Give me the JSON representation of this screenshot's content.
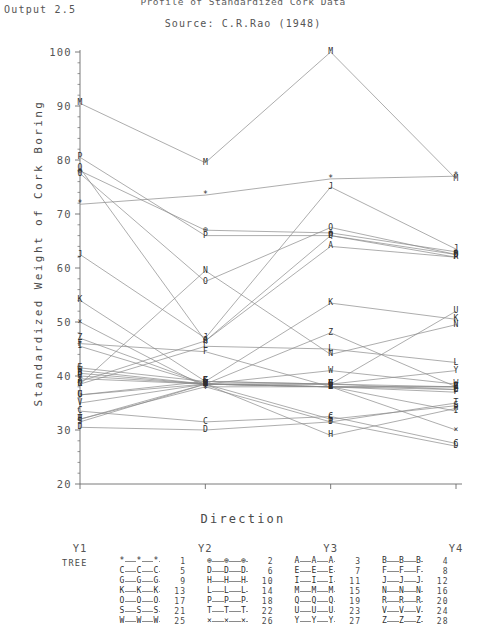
{
  "header": {
    "output_label": "Output 2.5",
    "title": "Profile of Standardized Cork Data",
    "source": "Source: C.R.Rao (1948)"
  },
  "chart_data": {
    "type": "line",
    "title": "Profile of Standardized Cork Data",
    "subtitle": "Source: C.R.Rao (1948)",
    "xlabel": "Direction",
    "ylabel": "Standardized Weight of Cork Boring",
    "categories": [
      "Y1",
      "Y2",
      "Y3",
      "Y4"
    ],
    "yticks": [
      20,
      30,
      40,
      50,
      60,
      70,
      80,
      90,
      100
    ],
    "ylim": [
      20,
      100
    ],
    "grid": false,
    "legend_position": "bottom",
    "legend_title": "TREE",
    "series": [
      {
        "name": "1",
        "marker": "*",
        "values": [
          71.8,
          73.5,
          76.5,
          77.0
        ]
      },
      {
        "name": "2",
        "marker": "⊕",
        "values": [
          78.0,
          67.0,
          66.5,
          63.0
        ]
      },
      {
        "name": "3",
        "marker": "A",
        "values": [
          39.0,
          46.5,
          64.0,
          62.0
        ]
      },
      {
        "name": "4",
        "marker": "B",
        "values": [
          40.5,
          38.5,
          38.0,
          37.5
        ]
      },
      {
        "name": "5",
        "marker": "C",
        "values": [
          33.5,
          31.5,
          32.5,
          27.5
        ]
      },
      {
        "name": "6",
        "marker": "D",
        "values": [
          30.5,
          30.0,
          31.5,
          27.0
        ]
      },
      {
        "name": "7",
        "marker": "E",
        "values": [
          41.5,
          39.0,
          38.5,
          37.5
        ]
      },
      {
        "name": "8",
        "marker": "F",
        "values": [
          46.0,
          44.5,
          38.0,
          37.0
        ]
      },
      {
        "name": "9",
        "marker": "G",
        "values": [
          36.5,
          39.0,
          38.5,
          38.0
        ]
      },
      {
        "name": "10",
        "marker": "H",
        "values": [
          32.0,
          38.5,
          29.0,
          34.0
        ]
      },
      {
        "name": "11",
        "marker": "I",
        "values": [
          45.5,
          38.5,
          38.0,
          33.5
        ]
      },
      {
        "name": "12",
        "marker": "J",
        "values": [
          62.5,
          47.0,
          75.0,
          63.5
        ]
      },
      {
        "name": "13",
        "marker": "K",
        "values": [
          54.0,
          39.0,
          53.5,
          50.5
        ]
      },
      {
        "name": "14",
        "marker": "L",
        "values": [
          38.5,
          45.5,
          45.0,
          42.5
        ]
      },
      {
        "name": "15",
        "marker": "M",
        "values": [
          90.5,
          79.5,
          100.0,
          76.5
        ]
      },
      {
        "name": "16",
        "marker": "N",
        "values": [
          38.5,
          59.5,
          44.0,
          49.5
        ]
      },
      {
        "name": "17",
        "marker": "O",
        "values": [
          77.5,
          57.5,
          67.5,
          62.5
        ]
      },
      {
        "name": "18",
        "marker": "P",
        "values": [
          80.5,
          66.0,
          66.0,
          62.0
        ]
      },
      {
        "name": "19",
        "marker": "Q",
        "values": [
          78.5,
          46.5,
          66.0,
          62.5
        ]
      },
      {
        "name": "20",
        "marker": "R",
        "values": [
          40.0,
          38.5,
          38.0,
          38.0
        ]
      },
      {
        "name": "21",
        "marker": "S",
        "values": [
          31.5,
          38.5,
          32.0,
          34.5
        ]
      },
      {
        "name": "22",
        "marker": "T",
        "values": [
          32.0,
          38.0,
          31.5,
          35.0
        ]
      },
      {
        "name": "23",
        "marker": "U",
        "values": [
          36.5,
          38.5,
          38.5,
          52.0
        ]
      },
      {
        "name": "24",
        "marker": "V",
        "values": [
          35.0,
          38.5,
          38.0,
          38.0
        ]
      },
      {
        "name": "25",
        "marker": "W",
        "values": [
          41.0,
          38.5,
          41.0,
          38.5
        ]
      },
      {
        "name": "26",
        "marker": "×",
        "values": [
          50.0,
          38.0,
          38.0,
          30.0
        ]
      },
      {
        "name": "27",
        "marker": "Y",
        "values": [
          39.5,
          38.5,
          38.5,
          41.0
        ]
      },
      {
        "name": "28",
        "marker": "Z",
        "values": [
          47.0,
          38.5,
          48.0,
          38.0
        ]
      }
    ]
  },
  "legend": {
    "title": "TREE",
    "entries": [
      {
        "symbol": "*",
        "number": "1"
      },
      {
        "symbol": "⊕",
        "number": "2"
      },
      {
        "symbol": "A",
        "number": "3"
      },
      {
        "symbol": "B",
        "number": "4"
      },
      {
        "symbol": "C",
        "number": "5"
      },
      {
        "symbol": "D",
        "number": "6"
      },
      {
        "symbol": "E",
        "number": "7"
      },
      {
        "symbol": "F",
        "number": "8"
      },
      {
        "symbol": "G",
        "number": "9"
      },
      {
        "symbol": "H",
        "number": "10"
      },
      {
        "symbol": "I",
        "number": "11"
      },
      {
        "symbol": "J",
        "number": "12"
      },
      {
        "symbol": "K",
        "number": "13"
      },
      {
        "symbol": "L",
        "number": "14"
      },
      {
        "symbol": "M",
        "number": "15"
      },
      {
        "symbol": "N",
        "number": "16"
      },
      {
        "symbol": "O",
        "number": "17"
      },
      {
        "symbol": "P",
        "number": "18"
      },
      {
        "symbol": "Q",
        "number": "19"
      },
      {
        "symbol": "R",
        "number": "20"
      },
      {
        "symbol": "S",
        "number": "21"
      },
      {
        "symbol": "T",
        "number": "22"
      },
      {
        "symbol": "U",
        "number": "23"
      },
      {
        "symbol": "V",
        "number": "24"
      },
      {
        "symbol": "W",
        "number": "25"
      },
      {
        "symbol": "×",
        "number": "26"
      },
      {
        "symbol": "Y",
        "number": "27"
      },
      {
        "symbol": "Z",
        "number": "28"
      }
    ]
  },
  "colors": {
    "line": "#8a8a8a",
    "text": "#4a4a4a",
    "axis": "#6b6b6b",
    "marker": "#2f2f2f"
  }
}
